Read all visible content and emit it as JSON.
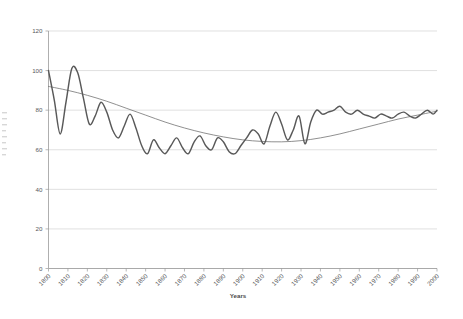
{
  "chart_data": {
    "type": "line",
    "title": "",
    "xlabel": "Years",
    "ylabel": "",
    "xlim": [
      1800,
      2000
    ],
    "ylim": [
      0,
      120
    ],
    "ytick_labels": [
      "0",
      "20",
      "40",
      "60",
      "80",
      "100",
      "120"
    ],
    "yticks": [
      0,
      20,
      40,
      60,
      80,
      100,
      120
    ],
    "xtick_labels": [
      "1800",
      "1810",
      "1820",
      "1830",
      "1840",
      "1850",
      "1860",
      "1870",
      "1880",
      "1890",
      "1900",
      "1910",
      "1920",
      "1930",
      "1940",
      "1950",
      "1960",
      "1970",
      "1980",
      "1990",
      "2000"
    ],
    "xticks": [
      1800,
      1810,
      1820,
      1830,
      1840,
      1850,
      1860,
      1870,
      1880,
      1890,
      1900,
      1910,
      1920,
      1930,
      1940,
      1950,
      1960,
      1970,
      1980,
      1990,
      2000
    ],
    "grid": "horizontal",
    "legend": "none",
    "colors": {
      "series": "#595959",
      "trend": "#6b6b6b",
      "gridline": "#d3d3d3",
      "axis": "#9a9a9a",
      "text": "#58595b",
      "background": "#ffffff"
    },
    "series": [
      {
        "name": "data",
        "style": "line",
        "x": [
          1800,
          1803,
          1806,
          1809,
          1812,
          1815,
          1818,
          1821,
          1824,
          1827,
          1830,
          1833,
          1836,
          1839,
          1842,
          1845,
          1848,
          1851,
          1854,
          1857,
          1860,
          1863,
          1866,
          1869,
          1872,
          1875,
          1878,
          1881,
          1884,
          1887,
          1890,
          1893,
          1896,
          1899,
          1902,
          1905,
          1908,
          1911,
          1914,
          1917,
          1920,
          1923,
          1926,
          1929,
          1932,
          1935,
          1938,
          1941,
          1944,
          1947,
          1950,
          1953,
          1956,
          1959,
          1962,
          1965,
          1968,
          1971,
          1974,
          1977,
          1980,
          1983,
          1986,
          1989,
          1992,
          1995,
          1998,
          2000
        ],
        "y": [
          100,
          85,
          68,
          84,
          101,
          99,
          86,
          73,
          77,
          84,
          79,
          70,
          66,
          72,
          78,
          71,
          62,
          58,
          65,
          61,
          58,
          62,
          66,
          61,
          58,
          64,
          67,
          62,
          60,
          66,
          64,
          59,
          58,
          62,
          66,
          70,
          68,
          63,
          72,
          79,
          73,
          65,
          70,
          77,
          63,
          74,
          80,
          78,
          79,
          80,
          82,
          79,
          78,
          80,
          78,
          77,
          76,
          78,
          77,
          76,
          78,
          79,
          77,
          76,
          78,
          80,
          78,
          80
        ]
      },
      {
        "name": "trend",
        "style": "smooth",
        "x": [
          1800,
          1810,
          1820,
          1830,
          1840,
          1850,
          1860,
          1870,
          1880,
          1890,
          1900,
          1910,
          1920,
          1930,
          1940,
          1950,
          1960,
          1970,
          1980,
          1990,
          2000
        ],
        "y": [
          92,
          90,
          87.5,
          84.5,
          81,
          77.5,
          74,
          71,
          68.5,
          66.5,
          65,
          64.2,
          64,
          64.6,
          66,
          68,
          70.5,
          73,
          75.5,
          77.5,
          79.5
        ]
      }
    ]
  },
  "axis": {
    "x_title": "Years"
  }
}
